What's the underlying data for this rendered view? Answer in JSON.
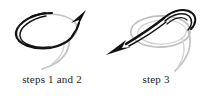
{
  "figure": {
    "background_color": "#ffffff",
    "stroke_dark": "#111111",
    "stroke_gray": "#b9b9b9",
    "stroke_mid_gray": "#8c8c8c",
    "text_color": "#1a1a1a"
  },
  "panels": [
    {
      "id": "steps-1-and-2",
      "caption": "steps 1 and 2",
      "arrow_direction": "up-right",
      "description": "loop drawn with dark stroke and faint gray trailing tail"
    },
    {
      "id": "step-3",
      "caption": "step 3",
      "arrow_direction": "down-left",
      "description": "gray loop crossed by dark strand pulled through toward lower left"
    }
  ]
}
